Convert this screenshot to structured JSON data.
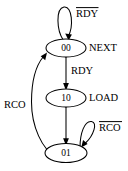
{
  "diagram": {
    "type": "finite-state-machine",
    "background_color": "#ffffff",
    "stroke_color": "#000000",
    "states": [
      {
        "id": "s00",
        "code": "00",
        "output": "NEXT",
        "cx": 66,
        "cy": 48
      },
      {
        "id": "s10",
        "code": "10",
        "output": "LOAD",
        "cx": 66,
        "cy": 98
      },
      {
        "id": "s01",
        "code": "01",
        "output": "",
        "cx": 66,
        "cy": 153
      }
    ],
    "transitions": [
      {
        "id": "t-00-self",
        "from": "00",
        "to": "00",
        "label": "RDY",
        "negated": true,
        "kind": "self-loop-top"
      },
      {
        "id": "t-00-10",
        "from": "00",
        "to": "10",
        "label": "RDY",
        "negated": false,
        "kind": "straight-down"
      },
      {
        "id": "t-10-01",
        "from": "10",
        "to": "01",
        "label": "",
        "negated": false,
        "kind": "straight-down"
      },
      {
        "id": "t-01-self",
        "from": "01",
        "to": "01",
        "label": "RCO",
        "negated": true,
        "kind": "self-loop-right"
      },
      {
        "id": "t-01-00",
        "from": "01",
        "to": "00",
        "label": "RCO",
        "negated": false,
        "kind": "curve-left"
      }
    ],
    "labels": {
      "not_rdy": "RDY",
      "rdy": "RDY",
      "not_rco": "RCO",
      "rco": "RCO",
      "state_00": "00",
      "state_10": "10",
      "state_01": "01",
      "output_next": "NEXT",
      "output_load": "LOAD"
    }
  }
}
